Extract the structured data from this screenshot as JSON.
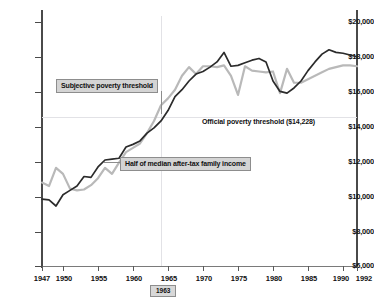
{
  "chart_data": {
    "type": "line",
    "title": "",
    "xlabel": "",
    "ylabel": "",
    "xlim": [
      1947,
      1992
    ],
    "ylim": [
      6000,
      20000
    ],
    "grid": "faint-reference-lines",
    "legend_position": "inline-annotations",
    "y_ticks": [
      "$6,000",
      "$8,000",
      "$10,000",
      "$12,000",
      "$14,000",
      "$16,000",
      "$18,000",
      "$20,000"
    ],
    "y_tick_values": [
      6000,
      8000,
      10000,
      12000,
      14000,
      16000,
      18000,
      20000
    ],
    "x_ticks": [
      "1947",
      "1950",
      "1955",
      "1960",
      "1965",
      "1970",
      "1975",
      "1980",
      "1985",
      "1990",
      "1992"
    ],
    "x_tick_values": [
      1947,
      1950,
      1955,
      1960,
      1965,
      1970,
      1975,
      1980,
      1985,
      1990,
      1992
    ],
    "reference_lines": [
      {
        "orientation": "horizontal",
        "value": 14228,
        "label": "Official poverty threshold ($14,228)"
      },
      {
        "orientation": "vertical",
        "value": 1963,
        "label": "1963"
      }
    ],
    "annotations": [
      {
        "text": "Subjective poverty threshold",
        "style": "boxed",
        "points_to_year": 1963
      },
      {
        "text": "Official poverty threshold ($14,228)",
        "style": "plain"
      },
      {
        "text": "Half of median after-tax family income",
        "style": "boxed",
        "points_to_year": 1957
      }
    ],
    "series": [
      {
        "name": "Subjective poverty threshold",
        "color": "#b9b9b9",
        "x": [
          1947,
          1948,
          1949,
          1950,
          1951,
          1952,
          1953,
          1954,
          1955,
          1956,
          1957,
          1958,
          1959,
          1960,
          1961,
          1962,
          1963,
          1964,
          1965,
          1966,
          1967,
          1968,
          1969,
          1970,
          1971,
          1972,
          1973,
          1974,
          1975,
          1976,
          1977,
          1978,
          1979,
          1980,
          1981,
          1982,
          1983,
          1984,
          1985,
          1986,
          1987,
          1988,
          1989,
          1990,
          1991,
          1992
        ],
        "values": [
          10750,
          10550,
          11600,
          11250,
          10400,
          10300,
          10350,
          10600,
          11000,
          11600,
          11250,
          11900,
          12500,
          12750,
          13000,
          13600,
          14300,
          15200,
          15600,
          16100,
          16900,
          17400,
          17000,
          17450,
          17450,
          17400,
          17500,
          16900,
          15800,
          17450,
          17200,
          17150,
          17100,
          17150,
          15900,
          17300,
          16500,
          16500,
          16700,
          16900,
          17100,
          17300,
          17400,
          17500,
          17500,
          17450
        ]
      },
      {
        "name": "Half of median after-tax family income",
        "color": "#2b2b2b",
        "x": [
          1947,
          1948,
          1949,
          1950,
          1951,
          1952,
          1953,
          1954,
          1955,
          1956,
          1957,
          1958,
          1959,
          1960,
          1961,
          1962,
          1963,
          1964,
          1965,
          1966,
          1967,
          1968,
          1969,
          1970,
          1971,
          1972,
          1973,
          1974,
          1975,
          1976,
          1977,
          1978,
          1979,
          1980,
          1981,
          1982,
          1983,
          1984,
          1985,
          1986,
          1987,
          1988,
          1989,
          1990,
          1991,
          1992
        ],
        "values": [
          9800,
          9750,
          9400,
          10050,
          10300,
          10550,
          11100,
          11050,
          11650,
          12050,
          12100,
          12150,
          12800,
          12950,
          13150,
          13600,
          13900,
          14300,
          14900,
          15700,
          16100,
          16600,
          17000,
          17150,
          17400,
          17700,
          18250,
          17450,
          17500,
          17650,
          17800,
          17900,
          17700,
          16600,
          16000,
          15900,
          16200,
          16600,
          17200,
          17700,
          18150,
          18400,
          18250,
          18200,
          18100,
          18000
        ]
      }
    ]
  },
  "axis": {
    "y_labels": [
      "$20,000",
      "$18,000",
      "$16,000",
      "$14,000",
      "$12,000",
      "$10,000",
      "$8,000",
      "$6,000"
    ],
    "x_labels": [
      "1947",
      "1950",
      "1955",
      "1960",
      "1965",
      "1970",
      "1975",
      "1980",
      "1985",
      "1990",
      "1992"
    ]
  },
  "annotations": {
    "subjective": "Subjective poverty threshold",
    "official": "Official poverty threshold ($14,228)",
    "median": "Half of median after-tax family income",
    "year_marker": "1963"
  },
  "colors": {
    "subjective_line": "#b9b9b9",
    "median_line": "#2b2b2b",
    "axis": "#4a4a4a",
    "reference": "#e2e2e6",
    "annotation_bg": "#d4d4d4",
    "annotation_border": "#8d8d8d"
  }
}
